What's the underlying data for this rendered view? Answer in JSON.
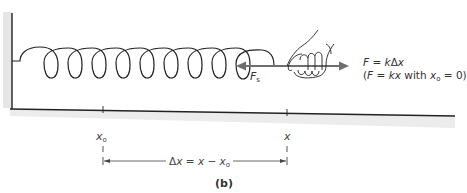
{
  "figure": {
    "caption": "(b)",
    "force_label": {
      "symbol": "F",
      "subscript": "s"
    },
    "equation": {
      "line1": {
        "lhs": "F",
        "eq": " = ",
        "k": "k",
        "delta": "Δ",
        "x": "x"
      },
      "line2": {
        "open": "(",
        "F": "F",
        "eq": " = ",
        "k": "k",
        "x": "x",
        "with": " with ",
        "x0": "x",
        "x0_sub": "o",
        "rest": " = 0)"
      }
    },
    "positions": {
      "x0_label": {
        "symbol": "x",
        "subscript": "o"
      },
      "x_label": {
        "symbol": "x"
      }
    },
    "displacement": {
      "delta": "Δ",
      "x": "x",
      "eq": " = ",
      "x2": "x",
      "minus": " − ",
      "x0": "x",
      "x0_sub": "o"
    },
    "colors": {
      "line": "#222222",
      "arrow": "#6e6e6e",
      "shadow": "#d9d9d9"
    }
  }
}
